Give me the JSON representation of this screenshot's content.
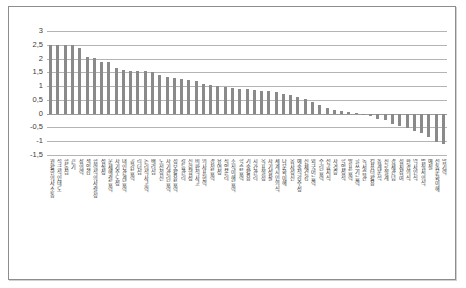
{
  "chart_data": {
    "type": "bar",
    "title": "",
    "subtitle": "",
    "xlabel": "",
    "ylabel": "",
    "ylim": [
      -1.5,
      3
    ],
    "yticks": [
      3,
      2.5,
      2,
      1.5,
      1,
      0.5,
      0,
      -0.5,
      -1,
      -1.5
    ],
    "ytick_labels": [
      "3",
      "2,5",
      "2",
      "1,5",
      "1",
      "0,5",
      "0",
      "-0,5",
      "-1",
      "-1,5"
    ],
    "grid": true,
    "legend": "none",
    "bar_color": "#8a8a8a",
    "gridline_color": "#b4b4b4",
    "categories": [
      "원활한 의사소통",
      "적극적인 태도",
      "협동심",
      "끈기",
      "창의력",
      "책임감",
      "협력적 의사결정",
      "성실성",
      "문제해결능력",
      "자기주도성",
      "대인관계능력",
      "공감능력",
      "리더십",
      "논리적 사고력",
      "배려심",
      "도전정신",
      "자기관리능력",
      "정보활용능력",
      "갈등관리",
      "신뢰형성",
      "비판적 사고",
      "의사표현력",
      "경청능력",
      "유연성",
      "직업윤리",
      "조직이해능력",
      "학습능력",
      "기술활용",
      "시간관리",
      "목표설정",
      "자기성찰",
      "세계시민의식",
      "다문화이해",
      "봉사정신",
      "예술적감수성",
      "신체건강",
      "외국어능력",
      "수리능력",
      "전공지식",
      "자격증",
      "학업성적",
      "발표능력",
      "글쓰기능력",
      "독서습관",
      "컴퓨터활용",
      "통계분석",
      "진로설계",
      "경제관념",
      "정치참여",
      "환경의식",
      "역사인식",
      "법질서의식",
      "예절",
      "전통문화이해",
      "암기력"
    ],
    "values": [
      2.5,
      2.5,
      2.49,
      2.48,
      2.37,
      2.05,
      2.01,
      1.89,
      1.88,
      1.66,
      1.6,
      1.56,
      1.55,
      1.54,
      1.52,
      1.4,
      1.32,
      1.29,
      1.25,
      1.23,
      1.19,
      1.08,
      1.05,
      1.02,
      0.97,
      0.93,
      0.9,
      0.88,
      0.86,
      0.84,
      0.82,
      0.78,
      0.72,
      0.66,
      0.6,
      0.52,
      0.44,
      0.3,
      0.2,
      0.12,
      0.08,
      0.05,
      0.03,
      -0.06,
      -0.1,
      -0.18,
      -0.24,
      -0.36,
      -0.44,
      -0.52,
      -0.62,
      -0.72,
      -0.86,
      -1.02,
      -1.1
    ]
  }
}
